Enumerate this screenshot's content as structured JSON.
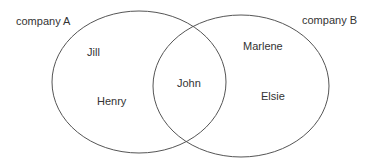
{
  "diagram": {
    "type": "venn",
    "colors": {
      "outline": "#555555",
      "text": "#333333",
      "background": "#ffffff"
    },
    "sets": [
      {
        "id": "A",
        "label": "company A",
        "only_members": [
          "Jill",
          "Henry"
        ]
      },
      {
        "id": "B",
        "label": "company B",
        "only_members": [
          "Marlene",
          "Elsie"
        ]
      }
    ],
    "intersection": {
      "sets": [
        "A",
        "B"
      ],
      "members": [
        "John"
      ]
    }
  }
}
